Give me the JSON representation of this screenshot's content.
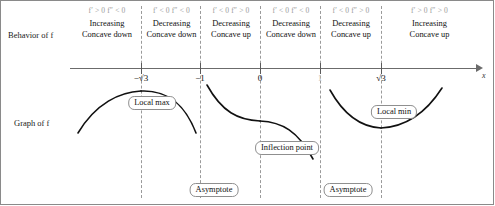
{
  "diagram": {
    "title_row_labels": {
      "behavior": "Behavior of f",
      "graph": "Graph of f"
    },
    "axis": {
      "variable_label": "x",
      "ticks": [
        {
          "label": "−√3",
          "value": -1.732,
          "x": 141
        },
        {
          "label": "−1",
          "value": -1,
          "x": 200
        },
        {
          "label": "0",
          "value": 0,
          "x": 260
        },
        {
          "label": "1",
          "value": 1,
          "x": 320
        },
        {
          "label": "√3",
          "value": 1.732,
          "x": 381
        }
      ]
    },
    "intervals": [
      {
        "id": "interval-1",
        "derivative_signs": "f′ > 0  f″ < 0",
        "first_derivative": "f′ > 0",
        "second_derivative": "f″ < 0",
        "monotonicity": "Increasing",
        "concavity": "Concave down",
        "left_x": 72,
        "width": 70
      },
      {
        "id": "interval-2",
        "derivative_signs": "f′ < 0  f″ < 0",
        "first_derivative": "f′ < 0",
        "second_derivative": "f″ < 0",
        "monotonicity": "Decreasing",
        "concavity": "Concave down",
        "left_x": 142,
        "width": 59
      },
      {
        "id": "interval-3",
        "derivative_signs": "f′ < 0  f″ > 0",
        "first_derivative": "f′ < 0",
        "second_derivative": "f″ > 0",
        "monotonicity": "Decreasing",
        "concavity": "Concave up",
        "left_x": 201,
        "width": 60
      },
      {
        "id": "interval-4",
        "derivative_signs": "f′ < 0  f″ < 0",
        "first_derivative": "f′ < 0",
        "second_derivative": "f″ < 0",
        "monotonicity": "Decreasing",
        "concavity": "Concave down",
        "left_x": 261,
        "width": 60
      },
      {
        "id": "interval-5",
        "derivative_signs": "f′ < 0  f″ > 0",
        "first_derivative": "f′ < 0",
        "second_derivative": "f″ > 0",
        "monotonicity": "Decreasing",
        "concavity": "Concave up",
        "left_x": 321,
        "width": 60
      },
      {
        "id": "interval-6",
        "derivative_signs": "f′ > 0  f″ > 0",
        "first_derivative": "f′ > 0",
        "second_derivative": "f″ > 0",
        "monotonicity": "Increasing",
        "concavity": "Concave up",
        "left_x": 381,
        "width": 97
      }
    ],
    "separators_x": [
      141,
      200,
      260,
      320,
      381
    ],
    "callouts": [
      {
        "id": "callout-local-max",
        "label": "Local max",
        "x": 152,
        "y": 96
      },
      {
        "id": "callout-inflection-point",
        "label": "Inflection point",
        "x": 287,
        "y": 141
      },
      {
        "id": "callout-asymptote-left",
        "label": "Asymptote",
        "x": 214,
        "y": 183
      },
      {
        "id": "callout-asymptote-right",
        "label": "Asymptote",
        "x": 348,
        "y": 183
      },
      {
        "id": "callout-local-min",
        "label": "Local min",
        "x": 394,
        "y": 105
      }
    ]
  },
  "colors": {
    "curve": "#111111",
    "axis": "#6b6b6b",
    "dashed_guide": "#9a9a9a",
    "sign_text": "#9a9a9a",
    "frame": "#8a8a8a"
  }
}
